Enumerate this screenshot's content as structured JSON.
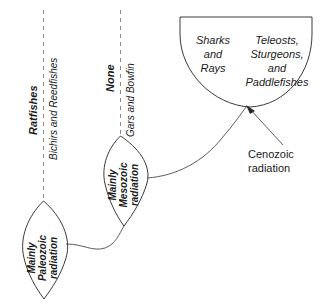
{
  "figure": {
    "background_color": "#ffffff",
    "line_color": "#3a3a3a",
    "dashed_line_color": "#8a8a8a"
  },
  "lineages": [
    {
      "id": "chondrichthyan-stem",
      "extant_label": "Ratfishes",
      "extant_label_style": "bold-italic",
      "secondary_label": "Bichirs and Reedfishes",
      "secondary_label_style": "italic",
      "radiation_label_line1": "Mainly",
      "radiation_label_line2": "Paleozoic",
      "radiation_label_line3": "radiation",
      "radiation_label_style": "bold-italic"
    },
    {
      "id": "neopterygian-stem",
      "extant_label": "None",
      "extant_label_style": "bold-italic",
      "secondary_label": "Gars and Bowfin",
      "secondary_label_style": "italic",
      "radiation_label_line1": "Mainly",
      "radiation_label_line2": "Mesozoic",
      "radiation_label_line3": "radiation",
      "radiation_label_style": "bold-italic"
    }
  ],
  "crown_fan": {
    "left_group": {
      "line1": "Sharks",
      "line2": "and",
      "line3": "Rays"
    },
    "right_group": {
      "line1": "Teleosts,",
      "line2": "Sturgeons,",
      "line3": "and",
      "line4": "Paddlefishes"
    },
    "label_style": "italic"
  },
  "annotation": {
    "line1": "Cenozoic",
    "line2": "radiation",
    "style": "plain"
  }
}
